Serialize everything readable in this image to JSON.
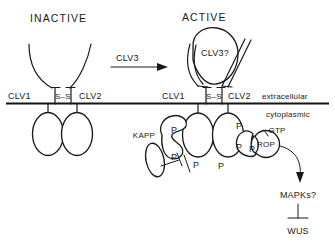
{
  "figure": {
    "type": "signaling-pathway-diagram",
    "background_color": "#ffffff",
    "line_color": "#1a1a1a"
  },
  "panels": {
    "inactive": {
      "title": "INACTIVE",
      "receptor_left_label": "CLV1",
      "receptor_right_label": "CLV2",
      "disulfide_label": "S–S"
    },
    "active": {
      "title": "ACTIVE",
      "ligand_label": "CLV3?",
      "receptor_left_label": "CLV1",
      "receptor_right_label": "CLV2",
      "disulfide_label": "S–S"
    }
  },
  "transition": {
    "arrow_label": "CLV3"
  },
  "membrane": {
    "outside_label": "extracellular",
    "inside_label": "cytoplasmic"
  },
  "cytoplasm": {
    "phosphatase_label": "KAPP",
    "gtpase_label": "ROP",
    "nucleotide_label": "GTP",
    "kinase_cascade_label": "MAPKs?",
    "target_gene_label": "WUS",
    "phospho_marks": [
      {
        "label": "P",
        "x": 212,
        "y": 137
      },
      {
        "label": "P",
        "x": 210,
        "y": 163
      },
      {
        "label": "P",
        "x": 194,
        "y": 167
      },
      {
        "label": "P",
        "x": 237,
        "y": 129
      },
      {
        "label": "P",
        "x": 237,
        "y": 150
      },
      {
        "label": "P",
        "x": 251,
        "y": 152
      },
      {
        "label": "P",
        "x": 196,
        "y": 170
      },
      {
        "label": "P",
        "x": 220,
        "y": 171
      }
    ]
  }
}
